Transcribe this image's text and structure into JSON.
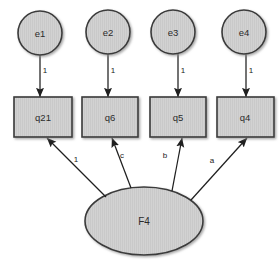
{
  "diagram": {
    "type": "sem-path-diagram",
    "title": "",
    "colors": {
      "shape_fill": "#d0d0d0",
      "shape_stroke": "#3a3a3a",
      "arrow_stroke": "#1f1f1f",
      "label_text": "#2b2b2b",
      "background": "#ffffff"
    },
    "latent_factors": [
      {
        "id": "F4",
        "label": "F4",
        "shape": "ellipse",
        "cx": 144,
        "cy": 221,
        "rx": 59,
        "ry": 34
      }
    ],
    "error_terms": [
      {
        "id": "e1",
        "label": "e1",
        "shape": "circle",
        "cx": 40,
        "cy": 33,
        "r": 22
      },
      {
        "id": "e2",
        "label": "e2",
        "shape": "circle",
        "cx": 108,
        "cy": 32,
        "r": 22
      },
      {
        "id": "e3",
        "label": "e3",
        "shape": "circle",
        "cx": 173,
        "cy": 32,
        "r": 22
      },
      {
        "id": "e4",
        "label": "e4",
        "shape": "circle",
        "cx": 244,
        "cy": 32,
        "r": 22
      }
    ],
    "indicators": [
      {
        "id": "q21",
        "label": "q21",
        "shape": "rect",
        "x": 14,
        "y": 97,
        "width": 58,
        "height": 40
      },
      {
        "id": "q6",
        "label": "q6",
        "shape": "rect",
        "x": 82,
        "y": 97,
        "width": 56,
        "height": 40
      },
      {
        "id": "q5",
        "label": "q5",
        "shape": "rect",
        "x": 150,
        "y": 97,
        "width": 56,
        "height": 40
      },
      {
        "id": "q4",
        "label": "q4",
        "shape": "rect",
        "x": 217,
        "y": 97,
        "width": 57,
        "height": 40
      }
    ],
    "error_paths": [
      {
        "id": "e1-q21",
        "from": "e1",
        "to": "q21",
        "label": "1",
        "x1": 40,
        "y1": 55,
        "x2": 40,
        "y2": 97,
        "label_x": 45,
        "label_y": 71
      },
      {
        "id": "e2-q6",
        "from": "e2",
        "to": "q6",
        "label": "1",
        "x1": 108,
        "y1": 54,
        "x2": 108,
        "y2": 97,
        "label_x": 113,
        "label_y": 71
      },
      {
        "id": "e3-q5",
        "from": "e3",
        "to": "q5",
        "label": "1",
        "x1": 178,
        "y1": 54,
        "x2": 178,
        "y2": 97,
        "label_x": 183,
        "label_y": 71
      },
      {
        "id": "e4-q4",
        "from": "e4",
        "to": "q4",
        "label": "1",
        "x1": 246,
        "y1": 54,
        "x2": 246,
        "y2": 97,
        "label_x": 251,
        "label_y": 71
      }
    ],
    "loading_paths": [
      {
        "id": "F4-q21",
        "from": "F4",
        "to": "q21",
        "label": "1",
        "x1": 106,
        "y1": 197,
        "x2": 47,
        "y2": 138,
        "label_x": 76,
        "label_y": 160
      },
      {
        "id": "F4-q6",
        "from": "F4",
        "to": "q6",
        "label": "c",
        "x1": 131,
        "y1": 188,
        "x2": 112,
        "y2": 138,
        "label_x": 122,
        "label_y": 156
      },
      {
        "id": "F4-q5",
        "from": "F4",
        "to": "q5",
        "label": "b",
        "x1": 172,
        "y1": 191,
        "x2": 182,
        "y2": 138,
        "label_x": 165,
        "label_y": 156
      },
      {
        "id": "F4-q4",
        "from": "F4",
        "to": "q4",
        "label": "a",
        "x1": 191,
        "y1": 200,
        "x2": 247,
        "y2": 138,
        "label_x": 212,
        "label_y": 161
      }
    ]
  }
}
